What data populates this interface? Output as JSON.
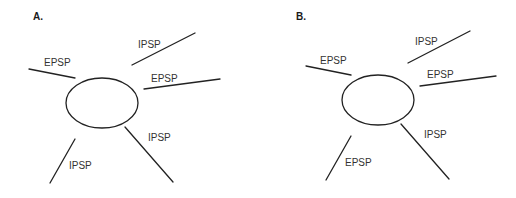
{
  "figure": {
    "panels": [
      {
        "id": "A",
        "label": "A.",
        "inputs": [
          {
            "label": "EPSP",
            "type": "excitatory",
            "direction": "upper-left"
          },
          {
            "label": "IPSP",
            "type": "inhibitory",
            "direction": "upper-right"
          },
          {
            "label": "EPSP",
            "type": "excitatory",
            "direction": "right"
          },
          {
            "label": "IPSP",
            "type": "inhibitory",
            "direction": "lower-right"
          },
          {
            "label": "IPSP",
            "type": "inhibitory",
            "direction": "lower-left"
          }
        ]
      },
      {
        "id": "B",
        "label": "B.",
        "inputs": [
          {
            "label": "EPSP",
            "type": "excitatory",
            "direction": "upper-left"
          },
          {
            "label": "IPSP",
            "type": "inhibitory",
            "direction": "upper-right"
          },
          {
            "label": "EPSP",
            "type": "excitatory",
            "direction": "right"
          },
          {
            "label": "IPSP",
            "type": "inhibitory",
            "direction": "lower-right"
          },
          {
            "label": "EPSP",
            "type": "excitatory",
            "direction": "lower-left"
          }
        ]
      }
    ],
    "colors": {
      "line": "#222222",
      "text": "#333333",
      "background": "#ffffff"
    }
  }
}
